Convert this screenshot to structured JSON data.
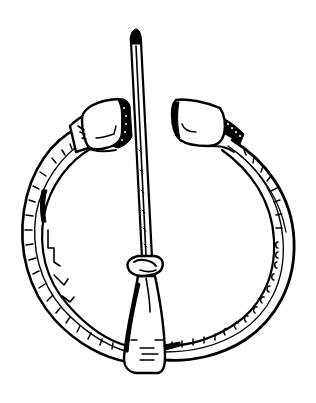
{
  "image": {
    "subject": "penannular brooch line drawing",
    "width": 316,
    "height": 403,
    "background": "#ffffff",
    "ink": "#000000"
  },
  "parts": {
    "ring": {
      "label": "hoop"
    },
    "left_terminal": {
      "label": "left terminal"
    },
    "right_terminal": {
      "label": "right terminal"
    },
    "pin": {
      "label": "pin"
    },
    "pin_collar": {
      "label": "pin loop"
    },
    "pin_base": {
      "label": "pin head"
    }
  }
}
